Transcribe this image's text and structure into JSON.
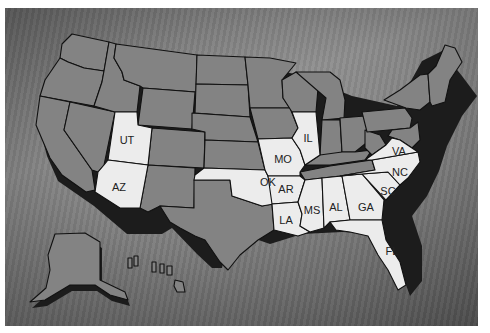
{
  "map": {
    "title": "United States map with highlighted states",
    "colors": {
      "background": "#777777",
      "state_default": "#838383",
      "state_highlighted": "#ececec",
      "border": "#111111",
      "label": "#222222"
    },
    "highlighted_states": [
      {
        "abbr": "UT",
        "x": 127,
        "y": 134
      },
      {
        "abbr": "AZ",
        "x": 119,
        "y": 188
      },
      {
        "abbr": "OK",
        "x": 270,
        "y": 182
      },
      {
        "abbr": "MO",
        "x": 283,
        "y": 159
      },
      {
        "abbr": "IL",
        "x": 307,
        "y": 137
      },
      {
        "abbr": "AR",
        "x": 285,
        "y": 189
      },
      {
        "abbr": "LA",
        "x": 286,
        "y": 220
      },
      {
        "abbr": "MS",
        "x": 313,
        "y": 210
      },
      {
        "abbr": "AL",
        "x": 336,
        "y": 207
      },
      {
        "abbr": "GA",
        "x": 366,
        "y": 207
      },
      {
        "abbr": "SC",
        "x": 388,
        "y": 191
      },
      {
        "abbr": "NC",
        "x": 400,
        "y": 172
      },
      {
        "abbr": "VA",
        "x": 399,
        "y": 151
      },
      {
        "abbr": "FL",
        "x": 392,
        "y": 252
      }
    ]
  }
}
